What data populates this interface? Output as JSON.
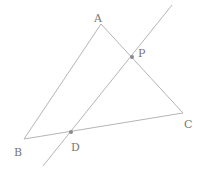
{
  "diagram": {
    "points": {
      "A": {
        "label": "A",
        "x": 101,
        "y": 24,
        "lx": 94,
        "ly": 22
      },
      "B": {
        "label": "B",
        "x": 24,
        "y": 139,
        "lx": 14,
        "ly": 156
      },
      "C": {
        "label": "C",
        "x": 183,
        "y": 113,
        "lx": 184,
        "ly": 128
      },
      "P": {
        "label": "P",
        "x": 132,
        "y": 57,
        "lx": 138,
        "ly": 57
      },
      "D": {
        "label": "D",
        "x": 71,
        "y": 132,
        "lx": 71,
        "ly": 151
      }
    },
    "line": {
      "x1": 43,
      "y1": 166,
      "x2": 172,
      "y2": 5
    },
    "stroke_color": "#b5b5b5",
    "dot_color": "#8a8a8a"
  }
}
